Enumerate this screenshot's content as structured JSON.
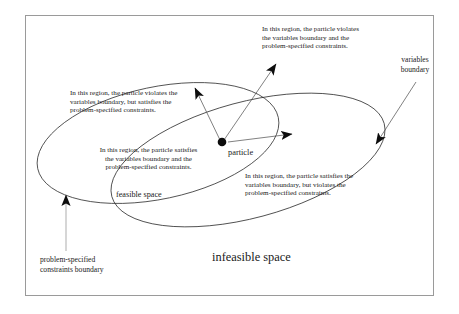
{
  "figure": {
    "type": "venn-region-diagram",
    "frame": {
      "present": true,
      "border_color": "#9a9a9a"
    },
    "background": "#ffffff",
    "ink_color": "#1a1a1a"
  },
  "annotations": {
    "top_right_note": "In this region, the particle violates\nthe variables boundary and the\nproblem-specified constraints.",
    "top_left_note": "In this region, the particle violates the\nvariables boundary, but satisfies the\nproblem-specified constraints.",
    "center_note": "In this region, the particle satisfies\nthe variables boundary and the\nproblem-specified constraints.",
    "bottom_right_note": "In this region, the particle satisfies the\nvariables boundary, but violates the\nproblem-specified constraints."
  },
  "labels": {
    "variables_boundary": "variables\nboundary",
    "problem_constraints_boundary": "problem-specified\nconstraints  boundary",
    "feasible_space": "feasible space",
    "infeasible_space": "infeasible space",
    "particle": "particle"
  },
  "shapes": {
    "constraints_ellipse": {
      "name": "problem-specified constraints boundary",
      "cx": 158,
      "cy": 143,
      "rx": 123,
      "ry": 56,
      "rotation_deg": -12
    },
    "variables_ellipse": {
      "name": "variables boundary",
      "cx": 248,
      "cy": 160,
      "rx": 141,
      "ry": 58,
      "rotation_deg": -15
    },
    "particle_dot": {
      "cx": 222,
      "cy": 142,
      "r": 4.2
    }
  },
  "arrows": [
    {
      "name": "arrow-to-top-right-note",
      "from": [
        224,
        140
      ],
      "to": [
        274,
        66
      ]
    },
    {
      "name": "arrow-to-top-left-note",
      "from": [
        220,
        140
      ],
      "to": [
        196,
        90
      ]
    },
    {
      "name": "arrow-to-bottom-right-note",
      "from": [
        228,
        142
      ],
      "to": [
        290,
        134
      ]
    },
    {
      "name": "arrow-to-variables-boundary",
      "from": [
        414,
        84
      ],
      "to": [
        375,
        143
      ]
    },
    {
      "name": "arrow-to-constraints-boundary",
      "from": [
        66,
        250
      ],
      "to": [
        66,
        196
      ]
    }
  ]
}
